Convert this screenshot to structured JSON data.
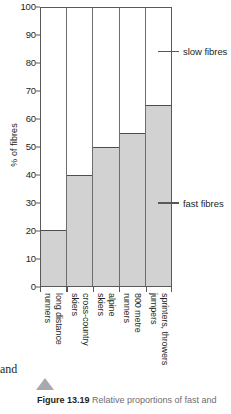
{
  "chart_data": {
    "type": "bar",
    "title": "",
    "xlabel": "",
    "ylabel": "% of fibres",
    "ylim": [
      0,
      100
    ],
    "yticks": [
      0,
      10,
      20,
      30,
      40,
      50,
      60,
      70,
      80,
      90,
      100
    ],
    "ytick_labels": [
      "0",
      "10",
      "20",
      "30",
      "40",
      "50",
      "60",
      "70",
      "80",
      "90",
      "100"
    ],
    "grid": false,
    "stacked": true,
    "categories": [
      "long distance runners",
      "cross-country skiers",
      "alpine skiers",
      "800 metre runners",
      "sprinters, throwers jumpers"
    ],
    "category_lines": [
      [
        "long distance",
        "runners"
      ],
      [
        "cross-country",
        "skiers"
      ],
      [
        "alpine",
        "skiers"
      ],
      [
        "800 metre",
        "runners"
      ],
      [
        "sprinters, throwers",
        "jumpers"
      ]
    ],
    "series": [
      {
        "name": "fast fibres",
        "values": [
          20,
          40,
          50,
          55,
          65
        ],
        "color": "#d2d2d2"
      },
      {
        "name": "slow fibres",
        "values": [
          80,
          60,
          50,
          45,
          35
        ],
        "color": "#ffffff"
      }
    ],
    "annotations": [
      {
        "label": "slow fibres",
        "value": 84
      },
      {
        "label": "fast fibres",
        "value": 30
      }
    ],
    "legend_position": "right-inline"
  },
  "legend": {
    "slow": "slow fibres",
    "fast": "fast fibres"
  },
  "caption": {
    "figure_number": "Figure 13.19",
    "body": "Relative proportions of fast and"
  },
  "margin": {
    "bleed_text": "and"
  },
  "colors": {
    "fast_fill": "#d2d2d2",
    "slow_fill": "#ffffff",
    "axis": "#58595b",
    "caption_gray": "#6d6e71",
    "triangle": "#a7a9ac"
  }
}
